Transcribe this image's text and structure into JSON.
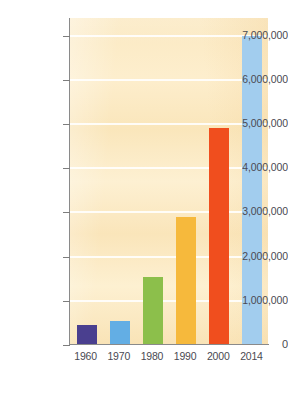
{
  "chart_data": {
    "type": "bar",
    "title": "",
    "subtitle": "",
    "xlabel": "",
    "ylabel": "",
    "categories": [
      "1960",
      "1970",
      "1980",
      "1990",
      "2000",
      "2014"
    ],
    "values": [
      450000,
      550000,
      1550000,
      2900000,
      4900000,
      7000000
    ],
    "series": [
      {
        "name": "",
        "values": [
          450000,
          550000,
          1550000,
          2900000,
          4900000,
          7000000
        ]
      }
    ],
    "bar_colors": [
      "#4a3f8f",
      "#63aee4",
      "#8cbf4b",
      "#f6b93c",
      "#f04e1e",
      "#a2cdee"
    ],
    "ylim": [
      0,
      7400000
    ],
    "yticks": [
      0,
      1000000,
      2000000,
      3000000,
      4000000,
      5000000,
      6000000,
      7000000
    ],
    "ytick_labels": [
      "0",
      "1,000,000",
      "2,000,000",
      "3,000,000",
      "4,000,000",
      "5,000,000",
      "6,000,000",
      "7,000,000"
    ],
    "grid": true,
    "grid_axis": "y",
    "legend": false,
    "legend_position": "none",
    "plot_background": "#fbe9c2",
    "axis_color": "#8a8a8a",
    "tick_label_color": "#4a4a52",
    "annotations": []
  }
}
